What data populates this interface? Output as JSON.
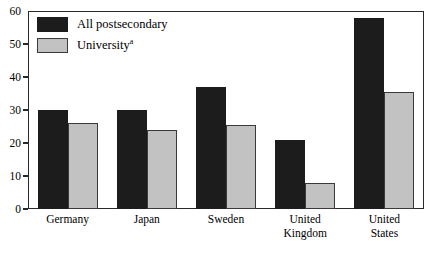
{
  "chart_data": {
    "type": "bar",
    "title": "",
    "subtitle": "",
    "xlabel": "",
    "ylabel": "",
    "ylim": [
      0,
      60
    ],
    "ytick_values": [
      60,
      50,
      40,
      30,
      20,
      10,
      0
    ],
    "ytick_labels": [
      "60",
      "50",
      "40",
      "30",
      "20",
      "10",
      "0"
    ],
    "grid": false,
    "legend_position": "top-left",
    "categories": [
      "Germany",
      "Japan",
      "Sweden",
      "United Kingdom",
      "United States"
    ],
    "category_lines": [
      [
        "Germany"
      ],
      [
        "Japan"
      ],
      [
        "Sweden"
      ],
      [
        "United",
        "Kingdom"
      ],
      [
        "United",
        "States"
      ]
    ],
    "series": [
      {
        "name": "All postsecondary",
        "color": "#1c1c1c",
        "values": [
          30,
          30,
          37,
          21,
          58
        ]
      },
      {
        "name": "University",
        "name_superscript": "a",
        "color": "#c2c2c2",
        "values": [
          26,
          24,
          25.5,
          8,
          35.5
        ]
      }
    ]
  },
  "legend": {
    "items": [
      {
        "label": "All postsecondary",
        "superscript": "",
        "swatch": "dark"
      },
      {
        "label": "University",
        "superscript": "a",
        "swatch": "light"
      }
    ]
  },
  "colors": {
    "series_dark": "#1c1c1c",
    "series_light": "#c2c2c2",
    "axis": "#2a2a2a",
    "background": "#ffffff",
    "text": "#000000"
  }
}
